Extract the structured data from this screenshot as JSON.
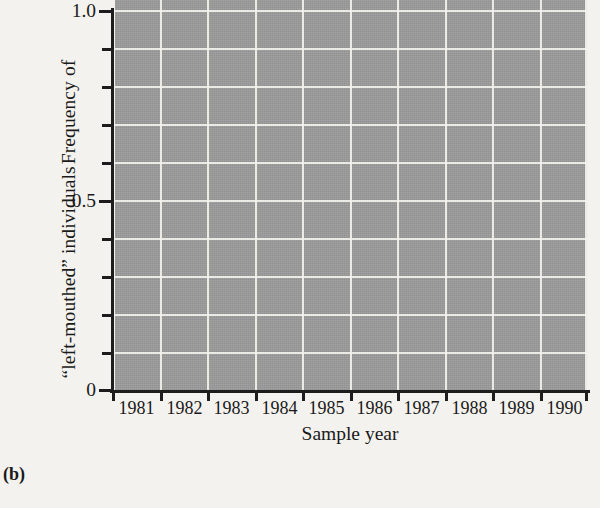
{
  "figure": {
    "panel_label": "(b)",
    "background_color": "#f4f2ee",
    "plot_background_color": "#9b9b9b",
    "gridline_color": "#f2f1ec",
    "series_color": "#3a3a3a",
    "reference_line_color": "#111111"
  },
  "axes": {
    "y_title_line1": "Frequency of",
    "y_title_line2": "“left-mouthed” individuals",
    "x_title": "Sample year",
    "y_tick_labels": [
      "1.0",
      "0.5",
      "0"
    ],
    "x_tick_labels": [
      "1981",
      "1982",
      "1983",
      "1984",
      "1985",
      "1986",
      "1987",
      "1988",
      "1989",
      "1990"
    ]
  },
  "chart_data": {
    "type": "line",
    "title": "",
    "subtitle": "",
    "xlabel": "Sample year",
    "ylabel": "Frequency of “left-mouthed” individuals",
    "x": [
      1981,
      1982,
      1983,
      1984,
      1985,
      1986,
      1987,
      1988,
      1989,
      1990
    ],
    "categories": [
      "1981",
      "1982",
      "1983",
      "1984",
      "1985",
      "1986",
      "1987",
      "1988",
      "1989",
      "1990"
    ],
    "series": [
      {
        "name": "Frequency of “left-mouthed” individuals",
        "values": [
          0.58,
          null,
          0.45,
          null,
          0.61,
          null,
          0.5,
          0.46,
          0.53,
          0.55
        ],
        "marker": "circle",
        "color": "#3a3a3a"
      }
    ],
    "points": [
      {
        "x": 1981,
        "y": 0.58
      },
      {
        "x": 1983,
        "y": 0.45
      },
      {
        "x": 1985,
        "y": 0.61
      },
      {
        "x": 1987,
        "y": 0.5
      },
      {
        "x": 1988,
        "y": 0.46
      },
      {
        "x": 1989,
        "y": 0.53
      },
      {
        "x": 1990,
        "y": 0.55
      }
    ],
    "reference_line": {
      "y": 0.5,
      "style": "dashed",
      "label": ""
    },
    "xlim": [
      1980.5,
      1990.5
    ],
    "ylim": [
      0,
      1.0
    ],
    "y_ticks": [
      0,
      0.1,
      0.2,
      0.3,
      0.4,
      0.5,
      0.6,
      0.7,
      0.8,
      0.9,
      1.0
    ],
    "y_labeled_ticks": [
      {
        "value": 1.0,
        "label": "1.0"
      },
      {
        "value": 0.5,
        "label": "0.5"
      },
      {
        "value": 0,
        "label": "0"
      }
    ],
    "grid": true,
    "legend": "none"
  }
}
